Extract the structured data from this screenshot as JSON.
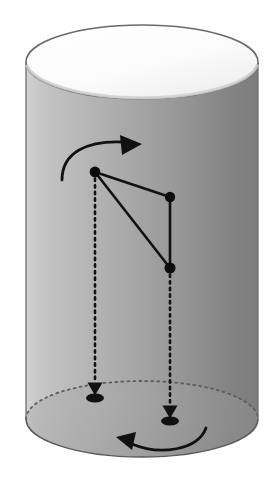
{
  "figure": {
    "canvas": {
      "width": 280,
      "height": 501,
      "background": "#ffffff"
    },
    "colors": {
      "body_light": "#c2c2c2",
      "body_mid": "#a8a8a8",
      "body_dark": "#7e7e7e",
      "top_face_light": "#fdfdfd",
      "top_face_shadow": "#e2e2e2",
      "outline": "#4a4a4a",
      "ink": "#101010",
      "background": "#ffffff"
    },
    "cylinder": {
      "label": "cylinder",
      "center_x": 142,
      "left_x": 26,
      "right_x": 258,
      "radius_x": 116,
      "radius_y": 38,
      "top_center_y": 62,
      "bottom_center_y": 419,
      "body_top_y": 62,
      "body_bottom_y": 419,
      "outline_width": 1.4
    },
    "top_face": {
      "label": "top-ellipse-face",
      "cx": 142,
      "cy": 62,
      "rx": 116,
      "ry": 37
    },
    "bottom_rim": {
      "label": "bottom-ellipse-rim",
      "cx": 142,
      "cy": 419,
      "rx": 116,
      "ry": 38,
      "front_visible": true,
      "back_dotted": true,
      "dash_pattern": "2,4"
    },
    "points": [
      {
        "id": "p1",
        "label": "point-a",
        "x": 95,
        "y": 172,
        "r": 5.4
      },
      {
        "id": "p2",
        "label": "point-b",
        "x": 170,
        "y": 197,
        "r": 5.2
      },
      {
        "id": "p3",
        "label": "point-c",
        "x": 170,
        "y": 268,
        "r": 5.6
      }
    ],
    "edges": [
      {
        "label": "edge-a-b",
        "from": "p1",
        "to": "p2",
        "width": 2.6
      },
      {
        "label": "edge-a-c",
        "from": "p1",
        "to": "p3",
        "width": 2.6
      },
      {
        "label": "edge-b-c",
        "from": "p2",
        "to": "p3",
        "width": 2.6
      }
    ],
    "projections": [
      {
        "label": "projection-a",
        "from_x": 95,
        "from_y": 172,
        "to_x": 95,
        "to_y": 383,
        "dash_pattern": "2.4,4.2",
        "width": 2.6,
        "arrowhead": {
          "x": 95,
          "y": 389,
          "half_width": 7.5,
          "height": 13
        },
        "foot_marker": {
          "cx": 95,
          "cy": 398,
          "rx": 9,
          "ry": 4.6
        }
      },
      {
        "label": "projection-c",
        "from_x": 170,
        "from_y": 268,
        "to_x": 170,
        "to_y": 406,
        "dash_pattern": "2.4,4.2",
        "width": 2.6,
        "arrowhead": {
          "x": 170,
          "y": 412,
          "half_width": 7.5,
          "height": 13
        },
        "foot_marker": {
          "cx": 170,
          "cy": 421,
          "rx": 9,
          "ry": 4.6
        }
      }
    ],
    "rotation_arrows": [
      {
        "label": "rotation-arrow-top",
        "direction": "clockwise-right",
        "path": "M 62,180 C 62,152 88,140 124,142",
        "width": 2.8,
        "arrowhead": {
          "tip_x": 142,
          "tip_y": 144,
          "back_x": 120,
          "back_y": 135,
          "side_x": 122,
          "side_y": 155
        }
      },
      {
        "label": "rotation-arrow-bottom",
        "direction": "counter-clockwise-left",
        "path": "M 206,428 C 198,450 160,456 132,444",
        "width": 2.8,
        "arrowhead": {
          "tip_x": 116,
          "tip_y": 437,
          "back_x": 136,
          "back_y": 432,
          "side_x": 132,
          "side_y": 450
        }
      }
    ]
  }
}
